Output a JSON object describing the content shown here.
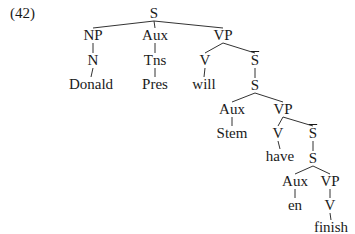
{
  "example_number": "(42)",
  "tree": {
    "nodes": [
      {
        "id": "S1",
        "label": "S",
        "x": 154,
        "y": 14
      },
      {
        "id": "NP",
        "label": "NP",
        "x": 93,
        "y": 36
      },
      {
        "id": "N",
        "label": "N",
        "x": 93,
        "y": 61
      },
      {
        "id": "Donald",
        "label": "Donald",
        "x": 91,
        "y": 85
      },
      {
        "id": "Aux1",
        "label": "Aux",
        "x": 155,
        "y": 36
      },
      {
        "id": "Tns",
        "label": "Tns",
        "x": 155,
        "y": 61
      },
      {
        "id": "Pres",
        "label": "Pres",
        "x": 155,
        "y": 85
      },
      {
        "id": "VP1",
        "label": "VP",
        "x": 223,
        "y": 36
      },
      {
        "id": "V1",
        "label": "V",
        "x": 205,
        "y": 61
      },
      {
        "id": "will",
        "label": "will",
        "x": 204,
        "y": 85
      },
      {
        "id": "Sbar1",
        "label": "S",
        "x": 255,
        "y": 61,
        "bar": true
      },
      {
        "id": "S2",
        "label": "S",
        "x": 255,
        "y": 86
      },
      {
        "id": "Aux2",
        "label": "Aux",
        "x": 232,
        "y": 110
      },
      {
        "id": "Stem",
        "label": "Stem",
        "x": 232,
        "y": 134
      },
      {
        "id": "VP2",
        "label": "VP",
        "x": 283,
        "y": 110
      },
      {
        "id": "V2",
        "label": "V",
        "x": 278,
        "y": 134
      },
      {
        "id": "have",
        "label": "have",
        "x": 280,
        "y": 157
      },
      {
        "id": "Sbar2",
        "label": "S",
        "x": 313,
        "y": 134,
        "bar": true
      },
      {
        "id": "S3",
        "label": "S",
        "x": 313,
        "y": 159
      },
      {
        "id": "Aux3",
        "label": "Aux",
        "x": 295,
        "y": 182
      },
      {
        "id": "en",
        "label": "en",
        "x": 295,
        "y": 206
      },
      {
        "id": "VP3",
        "label": "VP",
        "x": 330,
        "y": 182
      },
      {
        "id": "V3",
        "label": "V",
        "x": 330,
        "y": 206
      },
      {
        "id": "finish",
        "label": "finish",
        "x": 331,
        "y": 228
      }
    ],
    "edges": [
      [
        "S1",
        "NP"
      ],
      [
        "S1",
        "Aux1"
      ],
      [
        "S1",
        "VP1"
      ],
      [
        "NP",
        "N"
      ],
      [
        "N",
        "Donald"
      ],
      [
        "Aux1",
        "Tns"
      ],
      [
        "Tns",
        "Pres"
      ],
      [
        "VP1",
        "V1"
      ],
      [
        "VP1",
        "Sbar1"
      ],
      [
        "V1",
        "will"
      ],
      [
        "Sbar1",
        "S2"
      ],
      [
        "S2",
        "Aux2"
      ],
      [
        "S2",
        "VP2"
      ],
      [
        "Aux2",
        "Stem"
      ],
      [
        "VP2",
        "V2"
      ],
      [
        "VP2",
        "Sbar2"
      ],
      [
        "V2",
        "have"
      ],
      [
        "Sbar2",
        "S3"
      ],
      [
        "S3",
        "Aux3"
      ],
      [
        "S3",
        "VP3"
      ],
      [
        "Aux3",
        "en"
      ],
      [
        "VP3",
        "V3"
      ],
      [
        "V3",
        "finish"
      ]
    ]
  }
}
